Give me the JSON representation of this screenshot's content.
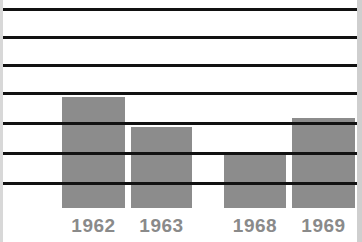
{
  "chart_data": {
    "type": "bar",
    "title": "",
    "subtitle": "",
    "xlabel": "",
    "ylabel": "",
    "categories": [
      "1962",
      "1963",
      "1968",
      "1969"
    ],
    "values": [
      4.0,
      2.9,
      1.9,
      3.2
    ],
    "series": [
      {
        "name": "",
        "values": [
          4.0,
          2.9,
          1.9,
          3.2
        ]
      }
    ],
    "ylim": [
      0,
      7
    ],
    "grid": true,
    "gridline_count": 7,
    "gridline_levels": [
      7,
      6,
      5,
      4,
      3,
      2,
      1
    ],
    "legend": "none",
    "bar_color": "#8c8c8c",
    "gridline_color": "#111111",
    "label_color": "#8a8a8a",
    "background_color": "#ffffff",
    "axis_visible": false,
    "tick_labels_y": []
  },
  "bars": [
    {
      "label": "1962",
      "value": 4.0,
      "left_px": 62,
      "width_px": 63,
      "top_px": 97,
      "height_px": 111,
      "label_left_px": 62,
      "label_width_px": 63
    },
    {
      "label": "1963",
      "value": 2.9,
      "left_px": 131,
      "width_px": 61,
      "top_px": 127,
      "height_px": 81,
      "label_left_px": 131,
      "label_width_px": 61
    },
    {
      "label": "1968",
      "value": 1.9,
      "left_px": 224,
      "width_px": 62,
      "top_px": 154,
      "height_px": 54,
      "label_left_px": 224,
      "label_width_px": 62
    },
    {
      "label": "1969",
      "value": 3.2,
      "left_px": 292,
      "width_px": 63,
      "top_px": 118,
      "height_px": 90,
      "label_left_px": 292,
      "label_width_px": 63
    }
  ],
  "gridlines": [
    {
      "y_px": 8
    },
    {
      "y_px": 36
    },
    {
      "y_px": 64
    },
    {
      "y_px": 92
    },
    {
      "y_px": 122
    },
    {
      "y_px": 152
    },
    {
      "y_px": 182
    }
  ]
}
